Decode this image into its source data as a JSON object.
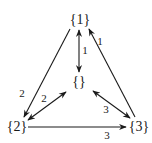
{
  "diagram": {
    "nodes": [
      {
        "id": "n1",
        "label": "{1}",
        "x": 80,
        "y": 20
      },
      {
        "id": "n0",
        "label": "{}",
        "x": 79,
        "y": 82
      },
      {
        "id": "n2",
        "label": "{2}",
        "x": 17,
        "y": 126
      },
      {
        "id": "n3",
        "label": "{3}",
        "x": 140,
        "y": 126
      }
    ],
    "edges": [
      {
        "from": "{1}",
        "to": "{2}",
        "direction": "forward",
        "label": "2"
      },
      {
        "from": "{2}",
        "to": "{}",
        "direction": "both",
        "label": "2"
      },
      {
        "from": "{1}",
        "to": "{}",
        "direction": "both",
        "label": "1"
      },
      {
        "from": "{3}",
        "to": "{1}",
        "direction": "forward",
        "label": "1"
      },
      {
        "from": "{}",
        "to": "{3}",
        "direction": "both",
        "label": "3"
      },
      {
        "from": "{2}",
        "to": "{3}",
        "direction": "forward",
        "label": "3"
      }
    ],
    "colors": {
      "stroke": "#1a1a1a",
      "background": "#ffffff"
    }
  }
}
